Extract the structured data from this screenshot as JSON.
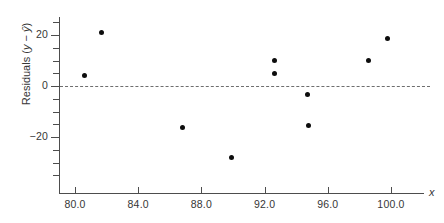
{
  "chart_data": {
    "type": "scatter",
    "title": "",
    "xlabel": "x",
    "ylabel": "Residuals (y − ŷ)",
    "ylabel_parts": {
      "prefix": "Residuals (",
      "y": "y",
      "minus": " − ",
      "yhat": "ŷ",
      "suffix": ")"
    },
    "xlim": [
      79.0,
      102.0
    ],
    "ylim": [
      -38.0,
      27.0
    ],
    "grid": false,
    "legend": null,
    "reference_line": {
      "name": "zero-residual-line",
      "y": 0,
      "style": "dashed",
      "color": "#6e6e6e"
    },
    "xticks": [
      80.0,
      84.0,
      88.0,
      92.0,
      96.0,
      100.0
    ],
    "xtick_labels": [
      "80.0",
      "84.0",
      "88.0",
      "92.0",
      "96.0",
      "100.0"
    ],
    "xminor_ticks": [],
    "yticks": [
      20,
      0,
      -20
    ],
    "ytick_labels": [
      "20",
      "0",
      "−20"
    ],
    "yminor_ticks": [
      25,
      15,
      10,
      5,
      -5,
      -10,
      -15,
      -25,
      -30,
      -35
    ],
    "points": [
      {
        "x": 80.6,
        "y": 4.3
      },
      {
        "x": 81.7,
        "y": 21.0
      },
      {
        "x": 86.8,
        "y": -16.2
      },
      {
        "x": 89.9,
        "y": -28.0
      },
      {
        "x": 92.6,
        "y": 10.0
      },
      {
        "x": 92.6,
        "y": 4.8
      },
      {
        "x": 94.7,
        "y": -3.2
      },
      {
        "x": 94.8,
        "y": -15.3
      },
      {
        "x": 98.6,
        "y": 10.0
      },
      {
        "x": 99.8,
        "y": 18.6
      }
    ],
    "marker": {
      "shape": "circle",
      "color": "#0d0d0d",
      "size": 5
    },
    "axis_color": "#4d4d4d",
    "text_color": "#363636",
    "background": "#ffffff"
  }
}
